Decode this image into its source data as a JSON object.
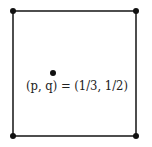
{
  "diagram": {
    "shape": "square",
    "stroke_color": "#222222",
    "vertices": [
      {
        "name": "top-left",
        "x": 13,
        "y": 11
      },
      {
        "name": "top-right",
        "x": 136,
        "y": 11
      },
      {
        "name": "bottom-right",
        "x": 136,
        "y": 136
      },
      {
        "name": "bottom-left",
        "x": 13,
        "y": 136
      }
    ],
    "interior_point": {
      "x": 53,
      "y": 73
    },
    "label": "(p, q) = (1/3, 1/2)"
  }
}
